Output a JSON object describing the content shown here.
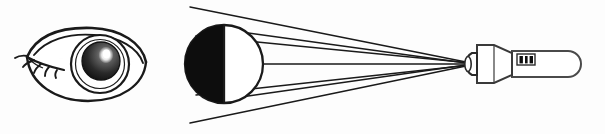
{
  "figure": {
    "background_color": "#fdfdfd",
    "stroke_color": "#1a1a1a",
    "fill_black": "#0d0d0d",
    "fill_white": "#ffffff",
    "width": 605,
    "height": 134
  },
  "eye_drawing": {
    "name": "human eye illustration",
    "center_x": 86,
    "center_y": 64,
    "outline_width": 120,
    "outline_height": 72,
    "iris_radius": 29,
    "pupil_radius": 19,
    "highlight": "upper-right specular highlight",
    "eyelash_count": 5,
    "eyelash_side": "left"
  },
  "globe": {
    "name": "schematic eyeball globe",
    "center_x": 224,
    "center_y": 64,
    "radius": 39,
    "left_half_fill": "#0d0d0d",
    "right_half_fill": "#ffffff",
    "divider_x": 224
  },
  "instrument": {
    "name": "condensing lens and handle instrument",
    "tip_x": 466,
    "tip_y": 64,
    "cap_x": 467,
    "cap_width": 9,
    "cap_height": 22,
    "bell_start_x": 476,
    "bell_end_x": 512,
    "bell_height_left": 38,
    "bell_height_right": 22,
    "handle_start_x": 512,
    "handle_end_x": 581,
    "handle_height": 26,
    "handle_corner_radius": 13,
    "switch": {
      "name": "slider switch",
      "x": 518,
      "y": 55,
      "width": 16,
      "height": 10,
      "bar_color": "#0d0d0d"
    }
  },
  "rays": {
    "name": "light ray bundle",
    "converge_x": 466,
    "converge_y": 64,
    "paths": [
      {
        "id": "outer-upper",
        "left_x": 190,
        "left_y": 7
      },
      {
        "id": "inner-upper",
        "left_x": 196,
        "left_y": 36
      },
      {
        "id": "globe-upper",
        "left_x": 241,
        "left_y": 32
      },
      {
        "id": "center",
        "left_x": 263,
        "left_y": 64
      },
      {
        "id": "globe-lower",
        "left_x": 241,
        "left_y": 97
      },
      {
        "id": "inner-lower",
        "left_x": 196,
        "left_y": 95
      },
      {
        "id": "outer-lower",
        "left_x": 190,
        "left_y": 123
      }
    ]
  }
}
